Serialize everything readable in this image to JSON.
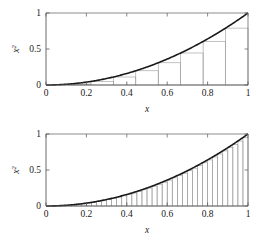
{
  "figure": {
    "background_color": "#ffffff",
    "width": 262,
    "height": 242,
    "panel_count": 2
  },
  "style": {
    "curve_color": "#1a1a1a",
    "rect_stroke_color": "#9a9a9a",
    "rect_fill_color": "none",
    "axis_color": "#595959",
    "text_color": "#1a1a1a"
  },
  "axis_labels": {
    "x_title": "x",
    "y_title_base": "x",
    "y_title_exponent": "2"
  },
  "ticks": {
    "x": [
      "0",
      "0.2",
      "0.4",
      "0.6",
      "0.8",
      "1"
    ],
    "x_values": [
      0,
      0.2,
      0.4,
      0.6,
      0.8,
      1
    ],
    "y": [
      "0",
      "0.5",
      "1"
    ],
    "y_values": [
      0,
      0.5,
      1
    ]
  },
  "chart_data": [
    {
      "type": "area",
      "panel": "top",
      "title": "",
      "subtitle": "",
      "xlabel": "x",
      "ylabel": "x^2",
      "xlim": [
        0,
        1
      ],
      "ylim": [
        0,
        1
      ],
      "grid": false,
      "legend": "none",
      "curve": {
        "name": "y = x^2",
        "function": "x^2",
        "x": [
          0,
          0.05,
          0.1,
          0.15,
          0.2,
          0.25,
          0.3,
          0.35,
          0.4,
          0.45,
          0.5,
          0.55,
          0.6,
          0.65,
          0.7,
          0.75,
          0.8,
          0.85,
          0.9,
          0.95,
          1
        ],
        "y": [
          0,
          0.0025,
          0.01,
          0.0225,
          0.04,
          0.0625,
          0.09,
          0.1225,
          0.16,
          0.2025,
          0.25,
          0.3025,
          0.36,
          0.4225,
          0.49,
          0.5625,
          0.64,
          0.7225,
          0.81,
          0.9025,
          1
        ]
      },
      "riemann": {
        "method": "left-endpoint",
        "n": 9,
        "width": 0.1111,
        "left_edges": [
          0,
          0.1111,
          0.2222,
          0.3333,
          0.4444,
          0.5556,
          0.6667,
          0.7778,
          0.8889
        ],
        "heights": [
          0,
          0.0123,
          0.0494,
          0.1111,
          0.1975,
          0.3086,
          0.4444,
          0.6049,
          0.7901
        ],
        "sum": 0.2798
      }
    },
    {
      "type": "area",
      "panel": "bottom",
      "title": "",
      "subtitle": "",
      "xlabel": "x",
      "ylabel": "x^2",
      "xlim": [
        0,
        1
      ],
      "ylim": [
        0,
        1
      ],
      "grid": false,
      "legend": "none",
      "curve": {
        "name": "y = x^2",
        "function": "x^2",
        "x": [
          0,
          0.05,
          0.1,
          0.15,
          0.2,
          0.25,
          0.3,
          0.35,
          0.4,
          0.45,
          0.5,
          0.55,
          0.6,
          0.65,
          0.7,
          0.75,
          0.8,
          0.85,
          0.9,
          0.95,
          1
        ],
        "y": [
          0,
          0.0025,
          0.01,
          0.0225,
          0.04,
          0.0625,
          0.09,
          0.1225,
          0.16,
          0.2025,
          0.25,
          0.3025,
          0.36,
          0.4225,
          0.49,
          0.5625,
          0.64,
          0.7225,
          0.81,
          0.9025,
          1
        ]
      },
      "riemann": {
        "method": "left-endpoint",
        "n": 40,
        "width": 0.025,
        "left_edges": [
          0,
          0.025,
          0.05,
          0.075,
          0.1,
          0.125,
          0.15,
          0.175,
          0.2,
          0.225,
          0.25,
          0.275,
          0.3,
          0.325,
          0.35,
          0.375,
          0.4,
          0.425,
          0.45,
          0.475,
          0.5,
          0.525,
          0.55,
          0.575,
          0.6,
          0.625,
          0.65,
          0.675,
          0.7,
          0.725,
          0.75,
          0.775,
          0.8,
          0.825,
          0.85,
          0.875,
          0.9,
          0.925,
          0.95,
          0.975
        ],
        "heights": [
          0,
          0.000625,
          0.0025,
          0.005625,
          0.01,
          0.015625,
          0.0225,
          0.030625,
          0.04,
          0.050625,
          0.0625,
          0.075625,
          0.09,
          0.105625,
          0.1225,
          0.140625,
          0.16,
          0.180625,
          0.2025,
          0.225625,
          0.25,
          0.275625,
          0.3025,
          0.330625,
          0.36,
          0.390625,
          0.4225,
          0.455625,
          0.49,
          0.525625,
          0.5625,
          0.600625,
          0.64,
          0.680625,
          0.7225,
          0.765625,
          0.81,
          0.855625,
          0.9025,
          0.950625
        ],
        "sum": 0.3209
      }
    }
  ]
}
